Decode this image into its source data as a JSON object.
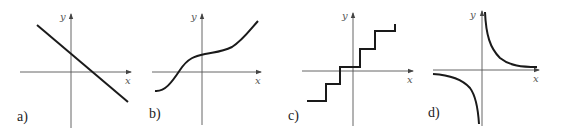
{
  "figure": {
    "panels": [
      {
        "id": "a",
        "label": "a)",
        "x_axis_label": "x",
        "y_axis_label": "y",
        "curve": "decreasing-straight-line"
      },
      {
        "id": "b",
        "label": "b)",
        "x_axis_label": "x",
        "y_axis_label": "y",
        "curve": "increasing-cubic-like"
      },
      {
        "id": "c",
        "label": "c)",
        "x_axis_label": "x",
        "y_axis_label": "y",
        "curve": "increasing-step-function"
      },
      {
        "id": "d",
        "label": "d)",
        "x_axis_label": "x",
        "y_axis_label": "y",
        "curve": "reciprocal-hyperbola"
      }
    ],
    "colors": {
      "curve": "#1a1a1a",
      "axis": "#555555",
      "background": "#ffffff"
    }
  }
}
